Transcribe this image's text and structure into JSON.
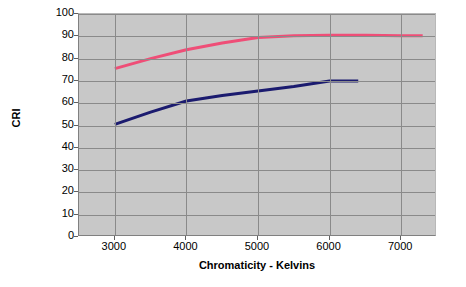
{
  "chart_data": {
    "type": "line",
    "title": "",
    "xlabel": "Chromaticity - Kelvins",
    "ylabel": "CRI",
    "xlim": [
      2500,
      7500
    ],
    "ylim": [
      0,
      100
    ],
    "xticks": [
      3000,
      4000,
      5000,
      6000,
      7000
    ],
    "yticks": [
      0,
      10,
      20,
      30,
      40,
      50,
      60,
      70,
      80,
      90,
      100
    ],
    "grid": true,
    "legend": "none",
    "plot_background": "#c8c8c8",
    "series": [
      {
        "name": "upper-cri-curve",
        "color": "#ef4e77",
        "x": [
          3000,
          3500,
          4000,
          4500,
          5000,
          5500,
          6000,
          6500,
          7000,
          7300
        ],
        "values": [
          75.5,
          80.0,
          84.0,
          87.0,
          89.5,
          90.3,
          90.5,
          90.5,
          90.3,
          90.2
        ]
      },
      {
        "name": "lower-cri-curve",
        "color": "#1b1b6f",
        "x": [
          3000,
          3500,
          4000,
          4500,
          5000,
          5500,
          6000,
          6400
        ],
        "values": [
          50.5,
          56.0,
          61.0,
          63.5,
          65.5,
          67.5,
          70.0,
          70.0
        ]
      }
    ]
  },
  "axis": {
    "y_title": "CRI",
    "x_title": "Chromaticity - Kelvins",
    "y_tick_labels": [
      "100",
      "90",
      "80",
      "70",
      "60",
      "50",
      "40",
      "30",
      "20",
      "10",
      "0"
    ],
    "x_tick_labels": [
      "3000",
      "4000",
      "5000",
      "6000",
      "7000"
    ]
  }
}
